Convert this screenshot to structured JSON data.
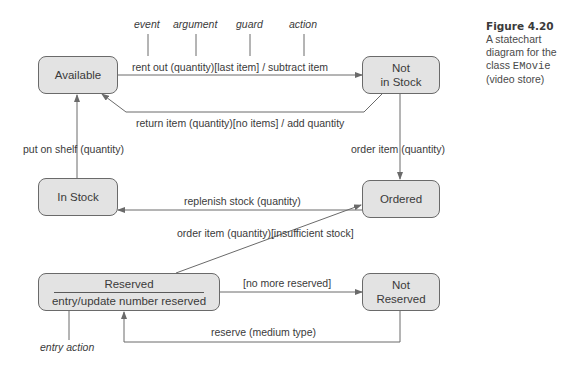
{
  "caption": {
    "figure_label": "Figure 4.20",
    "line1": "A statechart",
    "line2": "diagram for the",
    "line3_prefix": "class ",
    "class_name": "EMovie",
    "line4": "(video store)"
  },
  "annotations": {
    "event": "event",
    "argument": "argument",
    "guard": "guard",
    "action": "action",
    "entry_action": "entry action"
  },
  "states": {
    "available": "Available",
    "not_in_stock_1": "Not",
    "not_in_stock_2": "in Stock",
    "in_stock": "In Stock",
    "ordered": "Ordered",
    "reserved": "Reserved",
    "reserved_entry": "entry/update number reserved",
    "not_reserved_1": "Not",
    "not_reserved_2": "Reserved"
  },
  "transitions": {
    "rent_out": "rent out (quantity)[last item] / subtract item",
    "return_item": "return item (quantity)[no items] / add quantity",
    "put_on_shelf": "put on shelf (quantity)",
    "order_item": "order item (quantity)",
    "replenish": "replenish stock (quantity)",
    "order_insufficient": "order item (quantity)[insufficient stock]",
    "no_more_reserved": "[no more reserved]",
    "reserve": "reserve (medium type)"
  },
  "colors": {
    "state_fill": "#e3e3e3",
    "line": "#6a6a6a"
  }
}
